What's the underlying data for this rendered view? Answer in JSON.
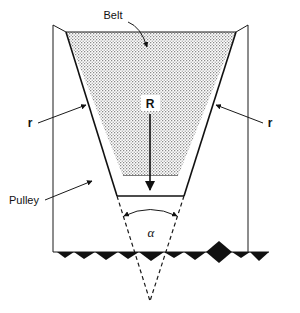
{
  "figure": {
    "type": "engineering-diagram",
    "width": 300,
    "height": 313,
    "background_color": "#ffffff",
    "line_color": "#111111",
    "belt_fill": "stipple-dot-pattern"
  },
  "labels": {
    "belt": "Belt",
    "pulley": "Pulley",
    "radius_left": "r",
    "radius_right": "r",
    "radius_major": "R",
    "angle": "α"
  },
  "annotations": [
    {
      "name": "belt-callout",
      "text": "Belt",
      "text_x": 113,
      "text_y": 18,
      "leader_from_x": 131,
      "leader_from_y": 22,
      "leader_to_x": 147,
      "leader_to_y": 48,
      "arrow": "end"
    },
    {
      "name": "radius-left-callout",
      "text": "r",
      "text_x": 30,
      "text_y": 126,
      "leader_from_x": 40,
      "leader_from_y": 122,
      "leader_to_x": 85,
      "leader_to_y": 104,
      "arrow": "end"
    },
    {
      "name": "radius-right-callout",
      "text": "r",
      "text_x": 268,
      "text_y": 126,
      "leader_from_x": 264,
      "leader_from_y": 122,
      "leader_to_x": 217,
      "leader_to_y": 104,
      "arrow": "end"
    },
    {
      "name": "pulley-callout",
      "text": "Pulley",
      "text_x": 10,
      "text_y": 203,
      "leader_from_x": 46,
      "leader_from_y": 199,
      "leader_to_x": 92,
      "leader_to_y": 180,
      "arrow": "end"
    },
    {
      "name": "radius-major-dimension",
      "text": "R",
      "text_x": 150,
      "text_y": 108,
      "leader_from_x": 150,
      "leader_from_y": 113,
      "leader_to_x": 150,
      "leader_to_y": 188,
      "arrow": "end"
    },
    {
      "name": "angle-dimension",
      "text": "α",
      "text_x": 150,
      "text_y": 234,
      "arrow": "both"
    }
  ],
  "geometry": {
    "pulley_outer_left_x": 53,
    "pulley_outer_right_x": 248,
    "pulley_top_y": 25,
    "pulley_base_y": 252,
    "rim_left_inner_x": 66,
    "rim_right_inner_x": 236,
    "rim_top_y": 32,
    "groove_bottom_left_x": 117,
    "groove_bottom_right_x": 184,
    "groove_bottom_y": 196,
    "belt_top_y": 32,
    "belt_bottom_y": 176,
    "belt_bottom_left_x": 123,
    "belt_bottom_right_x": 178,
    "apex_x": 150,
    "apex_y": 301
  },
  "ground": {
    "name": "section-hatch-ground",
    "baseline_y": 252,
    "teeth": [
      {
        "x": 57,
        "w": 17,
        "h": 6
      },
      {
        "x": 74,
        "w": 21,
        "h": 7
      },
      {
        "x": 95,
        "w": 23,
        "h": 8
      },
      {
        "x": 118,
        "w": 21,
        "h": 7
      },
      {
        "x": 139,
        "w": 25,
        "h": 9
      },
      {
        "x": 164,
        "w": 20,
        "h": 6
      },
      {
        "x": 184,
        "w": 22,
        "h": 8
      },
      {
        "x": 206,
        "w": 26,
        "h": 11
      },
      {
        "x": 232,
        "w": 18,
        "h": 6
      },
      {
        "x": 250,
        "w": 19,
        "h": 9
      }
    ]
  }
}
